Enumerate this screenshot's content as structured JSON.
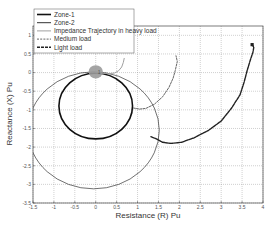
{
  "chart_data": {
    "type": "line",
    "title": "",
    "xlabel": "Resistance (R) Pu",
    "ylabel": "Reactance (X) Pu",
    "xlim": [
      -1.5,
      4
    ],
    "ylim": [
      -3.5,
      1.25
    ],
    "xticks": [
      -1.5,
      -1,
      -0.5,
      0,
      0.5,
      1,
      1.5,
      2,
      2.5,
      3,
      3.5,
      4
    ],
    "xtick_labels": [
      "-1.5",
      "-1",
      "-0.5",
      "0",
      "0.5",
      "1",
      "1.5",
      "2",
      "2.5",
      "3",
      "3.5",
      "4"
    ],
    "yticks": [
      1,
      0.5,
      0,
      -0.5,
      -1,
      -1.5,
      -2,
      -2.5,
      -3,
      -3.5
    ],
    "ytick_labels": [
      "1",
      "0.5",
      "0",
      "-0.5",
      "-1",
      "-1.5",
      "-2",
      "-2.5",
      "-3",
      "-3.5"
    ],
    "grid": true,
    "legend_position": "upper left",
    "legend": [
      "Zone-1",
      "Zone-2",
      "Impedance Trajectory in heavy load",
      "Medium load",
      "Light load"
    ],
    "series": [
      {
        "name": "Zone-1",
        "kind": "circle",
        "center": [
          0.0,
          -0.9
        ],
        "radius": 0.88,
        "color": "#111111",
        "width": 1.6,
        "dash": ""
      },
      {
        "name": "Zone-2",
        "kind": "circle",
        "center": [
          -0.05,
          -1.55
        ],
        "radius": 1.57,
        "color": "#333333",
        "width": 0.7,
        "dash": ""
      },
      {
        "name": "Impedance Trajectory in heavy load",
        "kind": "line",
        "color": "#a0a0a0",
        "width": 1.0,
        "dash": "",
        "x": [
          0.0,
          0.15,
          0.3,
          0.45,
          0.55,
          0.62,
          0.66,
          0.68
        ],
        "y": [
          0.0,
          -0.02,
          -0.03,
          -0.01,
          0.05,
          0.15,
          0.27,
          0.38
        ]
      },
      {
        "name": "Medium load",
        "kind": "line",
        "color": "#666666",
        "width": 1.0,
        "dash": "2,1.2",
        "x": [
          0.9,
          1.05,
          1.2,
          1.4,
          1.6,
          1.75,
          1.85,
          1.9,
          1.95,
          1.92
        ],
        "y": [
          -0.95,
          -0.98,
          -0.96,
          -0.85,
          -0.65,
          -0.4,
          -0.15,
          0.05,
          0.3,
          0.45
        ]
      },
      {
        "name": "Light load",
        "kind": "line",
        "color": "#222222",
        "width": 1.4,
        "dash": "3,1",
        "x": [
          1.32,
          1.45,
          1.6,
          1.8,
          2.05,
          2.35,
          2.7,
          3.0,
          3.25,
          3.45,
          3.55,
          3.62,
          3.7,
          3.76,
          3.78,
          3.74
        ],
        "y": [
          -1.72,
          -1.78,
          -1.87,
          -1.9,
          -1.87,
          -1.75,
          -1.55,
          -1.3,
          -0.95,
          -0.6,
          -0.25,
          0.05,
          0.35,
          0.55,
          0.68,
          0.75
        ],
        "end_marker": [
          3.74,
          0.75
        ]
      }
    ],
    "annotations": [
      {
        "kind": "blob",
        "center": [
          0.0,
          0.02
        ],
        "rx": 0.17,
        "ry": 0.18,
        "color": "#9a9a9a",
        "label": "1"
      }
    ]
  }
}
